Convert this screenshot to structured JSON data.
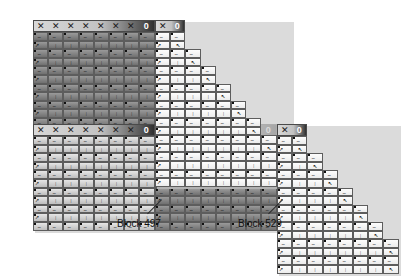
{
  "figure": {
    "type": "block-staircase-matrix-diagram",
    "width": 312,
    "height": 243,
    "background": "#ffffff"
  },
  "glyphs": {
    "header_mark": "✕",
    "header_zero": "0",
    "cell_wave": "∼",
    "cell_bar": "|",
    "cell_arrow": "↗",
    "cell_diag": "↖"
  },
  "header": {
    "marks_per_block": 7,
    "zero_label": "0"
  },
  "colors": {
    "dark_block": "#8c8c8c",
    "darker_block": "#7a7a7a",
    "light_block": "#f2f2f2",
    "mid_block": "#d9d9d9",
    "cell_border": "#5d5d5d",
    "header_border": "#4a4a4a",
    "shadow": "#cfcfcf",
    "text": "#111111"
  },
  "blocks": [
    {
      "id": "b1",
      "x": 33,
      "y": 20,
      "cols": 8,
      "rows": 12,
      "shade": "dark",
      "header": true
    },
    {
      "id": "b2",
      "x": 33,
      "y": 124,
      "cols": 8,
      "rows": 11,
      "shade": "mid",
      "header": true
    },
    {
      "id": "b3",
      "x": 155,
      "y": 124,
      "cols": 8,
      "rows": 11,
      "shade": "dark",
      "header": true
    }
  ],
  "stairs": [
    {
      "id": "s1",
      "x": 155,
      "y": 20,
      "steps": 9,
      "shade": "light",
      "header": true
    },
    {
      "id": "s2",
      "x": 277,
      "y": 124,
      "steps": 8,
      "shade": "light",
      "header": true
    }
  ],
  "annotations": [
    {
      "id": "ann-497",
      "label": "Block 497",
      "label_x": 117,
      "label_y": 218,
      "leader": {
        "x1": 162,
        "y1": 200,
        "x2": 148,
        "y2": 214
      }
    },
    {
      "id": "ann-529",
      "label": "Block 529",
      "label_x": 238,
      "label_y": 218,
      "leader": {
        "x1": 283,
        "y1": 200,
        "x2": 269,
        "y2": 214
      }
    }
  ]
}
